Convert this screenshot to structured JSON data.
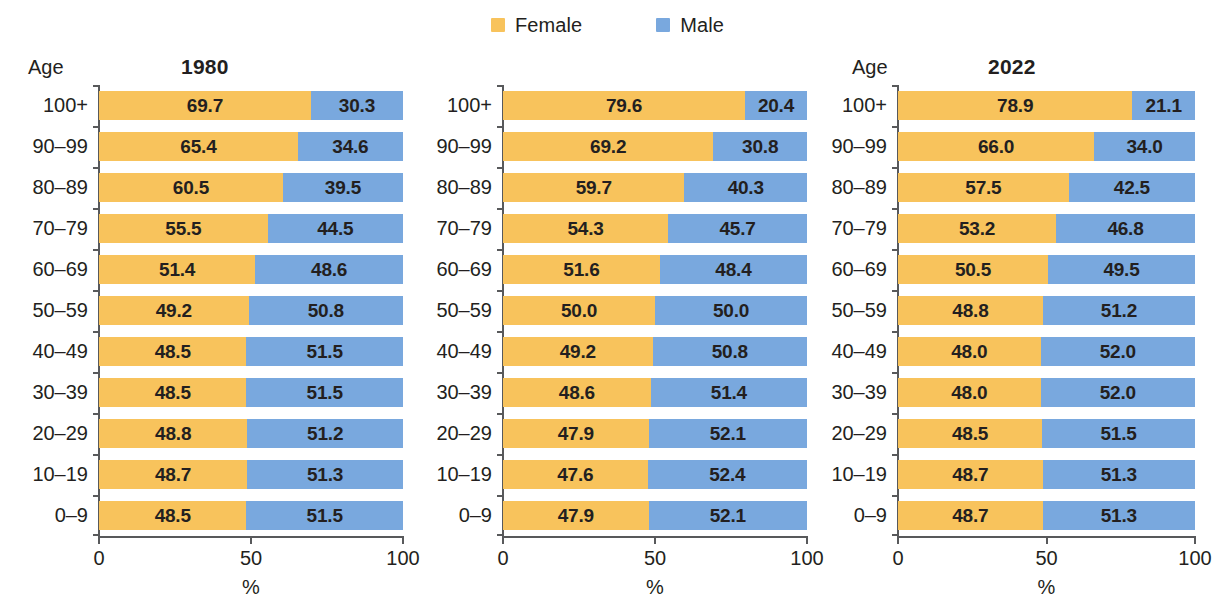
{
  "legend": {
    "items": [
      {
        "label": "Female",
        "color": "#F8C35C",
        "icon": "legend-swatch-female"
      },
      {
        "label": "Male",
        "color": "#79A8DE",
        "icon": "legend-swatch-male"
      }
    ]
  },
  "axis": {
    "age_header": "Age",
    "x_title": "%",
    "x_ticks": [
      "0",
      "50",
      "100"
    ]
  },
  "chart_data": {
    "type": "bar",
    "subtype": "100% stacked horizontal bar",
    "title": "",
    "xlabel": "%",
    "ylabel": "Age",
    "xlim": [
      0,
      100
    ],
    "grid": false,
    "legend_position": "top-center",
    "categories": [
      "100+",
      "90–99",
      "80–89",
      "70–79",
      "60–69",
      "50–59",
      "40–49",
      "30–39",
      "20–29",
      "10–19",
      "0–9"
    ],
    "series_names": [
      "Female",
      "Male"
    ],
    "series_colors": [
      "#F8C35C",
      "#79A8DE"
    ],
    "panels": [
      {
        "title": "1980",
        "age_header": "Age",
        "x_ticks": [
          "0",
          "50",
          "100"
        ],
        "x_title": "%",
        "rows": [
          {
            "age": "100+",
            "female": 69.7,
            "male": 30.3,
            "female_label": "69.7",
            "male_label": "30.3"
          },
          {
            "age": "90–99",
            "female": 65.4,
            "male": 34.6,
            "female_label": "65.4",
            "male_label": "34.6"
          },
          {
            "age": "80–89",
            "female": 60.5,
            "male": 39.5,
            "female_label": "60.5",
            "male_label": "39.5"
          },
          {
            "age": "70–79",
            "female": 55.5,
            "male": 44.5,
            "female_label": "55.5",
            "male_label": "44.5"
          },
          {
            "age": "60–69",
            "female": 51.4,
            "male": 48.6,
            "female_label": "51.4",
            "male_label": "48.6"
          },
          {
            "age": "50–59",
            "female": 49.2,
            "male": 50.8,
            "female_label": "49.2",
            "male_label": "50.8"
          },
          {
            "age": "40–49",
            "female": 48.5,
            "male": 51.5,
            "female_label": "48.5",
            "male_label": "51.5"
          },
          {
            "age": "30–39",
            "female": 48.5,
            "male": 51.5,
            "female_label": "48.5",
            "male_label": "51.5"
          },
          {
            "age": "20–29",
            "female": 48.8,
            "male": 51.2,
            "female_label": "48.8",
            "male_label": "51.2"
          },
          {
            "age": "10–19",
            "female": 48.7,
            "male": 51.3,
            "female_label": "48.7",
            "male_label": "51.3"
          },
          {
            "age": "0–9",
            "female": 48.5,
            "male": 51.5,
            "female_label": "48.5",
            "male_label": "51.5"
          }
        ]
      },
      {
        "title": "2022",
        "age_header": "Age",
        "x_ticks": [
          "0",
          "50",
          "100"
        ],
        "x_title": "%",
        "rows": [
          {
            "age": "100+",
            "female": 79.6,
            "male": 20.4,
            "female_label": "79.6",
            "male_label": "20.4"
          },
          {
            "age": "90–99",
            "female": 69.2,
            "male": 30.8,
            "female_label": "69.2",
            "male_label": "30.8"
          },
          {
            "age": "80–89",
            "female": 59.7,
            "male": 40.3,
            "female_label": "59.7",
            "male_label": "40.3"
          },
          {
            "age": "70–79",
            "female": 54.3,
            "male": 45.7,
            "female_label": "54.3",
            "male_label": "45.7"
          },
          {
            "age": "60–69",
            "female": 51.6,
            "male": 48.4,
            "female_label": "51.6",
            "male_label": "48.4"
          },
          {
            "age": "50–59",
            "female": 50.0,
            "male": 50.0,
            "female_label": "50.0",
            "male_label": "50.0"
          },
          {
            "age": "40–49",
            "female": 49.2,
            "male": 50.8,
            "female_label": "49.2",
            "male_label": "50.8"
          },
          {
            "age": "30–39",
            "female": 48.6,
            "male": 51.4,
            "female_label": "48.6",
            "male_label": "51.4"
          },
          {
            "age": "20–29",
            "female": 47.9,
            "male": 52.1,
            "female_label": "47.9",
            "male_label": "52.1"
          },
          {
            "age": "10–19",
            "female": 47.6,
            "male": 52.4,
            "female_label": "47.6",
            "male_label": "52.4"
          },
          {
            "age": "0–9",
            "female": 47.9,
            "male": 52.1,
            "female_label": "47.9",
            "male_label": "52.1"
          }
        ]
      },
      {
        "title": "2050",
        "age_header": "Age",
        "x_ticks": [
          "0",
          "50",
          "100"
        ],
        "x_title": "%",
        "rows": [
          {
            "age": "100+",
            "female": 78.9,
            "male": 21.1,
            "female_label": "78.9",
            "male_label": "21.1"
          },
          {
            "age": "90–99",
            "female": 66.0,
            "male": 34.0,
            "female_label": "66.0",
            "male_label": "34.0"
          },
          {
            "age": "80–89",
            "female": 57.5,
            "male": 42.5,
            "female_label": "57.5",
            "male_label": "42.5"
          },
          {
            "age": "70–79",
            "female": 53.2,
            "male": 46.8,
            "female_label": "53.2",
            "male_label": "46.8"
          },
          {
            "age": "60–69",
            "female": 50.5,
            "male": 49.5,
            "female_label": "50.5",
            "male_label": "49.5"
          },
          {
            "age": "50–59",
            "female": 48.8,
            "male": 51.2,
            "female_label": "48.8",
            "male_label": "51.2"
          },
          {
            "age": "40–49",
            "female": 48.0,
            "male": 52.0,
            "female_label": "48.0",
            "male_label": "52.0"
          },
          {
            "age": "30–39",
            "female": 48.0,
            "male": 52.0,
            "female_label": "48.0",
            "male_label": "52.0"
          },
          {
            "age": "20–29",
            "female": 48.5,
            "male": 51.5,
            "female_label": "48.5",
            "male_label": "51.5"
          },
          {
            "age": "10–19",
            "female": 48.7,
            "male": 51.3,
            "female_label": "48.7",
            "male_label": "51.3"
          },
          {
            "age": "0–9",
            "female": 48.7,
            "male": 51.3,
            "female_label": "48.7",
            "male_label": "51.3"
          }
        ]
      }
    ]
  }
}
